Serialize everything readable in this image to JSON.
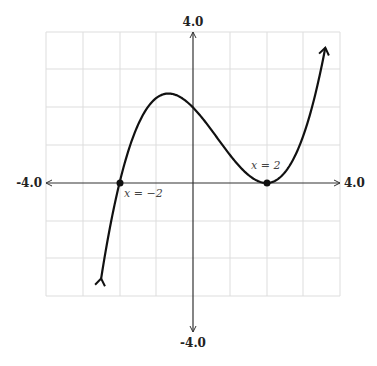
{
  "chart_data": {
    "type": "line",
    "title": "",
    "xlabel": "",
    "ylabel": "",
    "xlim": [
      -4.0,
      4.0
    ],
    "ylim": [
      -4.0,
      4.0
    ],
    "grid": true,
    "axis_labels": {
      "x_min": "-4.0",
      "x_max": "4.0",
      "y_min": "-4.0",
      "y_max": "4.0"
    },
    "series": [
      {
        "name": "f(x) = 0.25(x+2)(x-2)^2",
        "x": [
          -2.5,
          -2.0,
          -1.5,
          -1.0,
          -0.667,
          0.0,
          0.5,
          1.0,
          1.5,
          2.0,
          2.5,
          3.0,
          3.6
        ],
        "y": [
          -2.53,
          0.0,
          1.53,
          2.25,
          2.37,
          2.0,
          1.41,
          0.75,
          0.22,
          0.0,
          0.28,
          1.25,
          3.58
        ]
      }
    ],
    "points": [
      {
        "x": -2,
        "y": 0,
        "label": "x = −2"
      },
      {
        "x": 2,
        "y": 0,
        "label": "x = 2"
      }
    ]
  },
  "labels": {
    "x_min": "-4.0",
    "x_max": "4.0",
    "y_min": "-4.0",
    "y_max": "4.0",
    "root_left": "x = −2",
    "root_right": "x = 2"
  },
  "colors": {
    "curve": "#111111",
    "axis": "#333333",
    "grid": "#dddddd"
  }
}
